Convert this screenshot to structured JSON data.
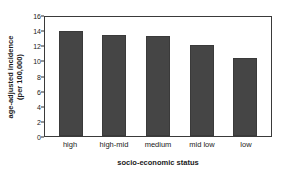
{
  "chart_data": {
    "type": "bar",
    "title": "",
    "categories": [
      "high",
      "high-mid",
      "medium",
      "mid low",
      "low"
    ],
    "values": [
      14.1,
      13.6,
      13.4,
      12.3,
      10.5
    ],
    "xlabel": "socio-economic status",
    "ylabel": "age-adjusted incidence",
    "ylabel_line2": "(per 100,000)",
    "ylim": [
      0,
      16
    ],
    "yticks": [
      0,
      2,
      4,
      6,
      8,
      10,
      12,
      14,
      16
    ],
    "ytick_labels": [
      "0",
      "2",
      "4",
      "6",
      "8",
      "10",
      "12",
      "14",
      "16"
    ],
    "grid": false,
    "legend": "none",
    "bar_color": "#454545",
    "frame_color": "#3a3a3a",
    "background": "#ffffff"
  }
}
